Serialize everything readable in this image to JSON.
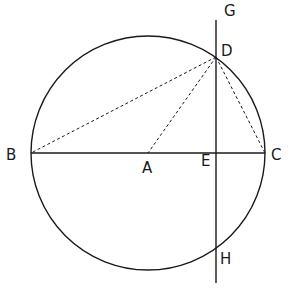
{
  "diagram": {
    "type": "geometry",
    "points": {
      "A": {
        "label": "A",
        "x": 148,
        "y": 153
      },
      "B": {
        "label": "B",
        "x": 31,
        "y": 153
      },
      "C": {
        "label": "C",
        "x": 265,
        "y": 153
      },
      "D": {
        "label": "D",
        "x": 216,
        "y": 57
      },
      "E": {
        "label": "E",
        "x": 216,
        "y": 153
      },
      "G": {
        "label": "G",
        "x": 216,
        "y": 20
      },
      "H": {
        "label": "H",
        "x": 216,
        "y": 249
      }
    },
    "circle": {
      "center": "A",
      "radius": 117
    },
    "segments": [
      {
        "from": "B",
        "to": "C",
        "style": "solid"
      },
      {
        "from": "G",
        "to": "H",
        "style": "solid"
      },
      {
        "from": "D",
        "to": "B",
        "style": "dashed"
      },
      {
        "from": "D",
        "to": "A",
        "style": "dashed"
      },
      {
        "from": "D",
        "to": "C",
        "style": "dashed"
      }
    ],
    "labels": {
      "A": "A",
      "B": "B",
      "C": "C",
      "D": "D",
      "E": "E",
      "G": "G",
      "H": "H"
    },
    "colors": {
      "stroke": "#1a1a1a",
      "background": "#ffffff"
    }
  }
}
